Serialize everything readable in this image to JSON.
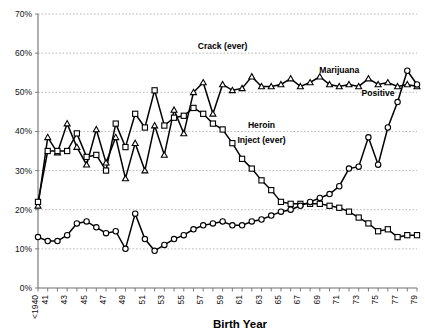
{
  "chart_data": {
    "type": "line",
    "title": "",
    "xlabel": "Birth Year",
    "ylabel": "",
    "ylim": [
      0,
      70
    ],
    "ytick_labels": [
      "0%",
      "10%",
      "20%",
      "30%",
      "40%",
      "50%",
      "60%",
      "70%"
    ],
    "ytick_values": [
      0,
      10,
      20,
      30,
      40,
      50,
      60,
      70
    ],
    "grid": true,
    "legend_position": "inline-annotations",
    "x": [
      "<1940",
      "1941",
      "1942",
      "1943",
      "1944",
      "1945",
      "1946",
      "1947",
      "1948",
      "1949",
      "1950",
      "1951",
      "1952",
      "1953",
      "1954",
      "1955",
      "1956",
      "1957",
      "1958",
      "1959",
      "1960",
      "1961",
      "1962",
      "1963",
      "1964",
      "1965",
      "1966",
      "1967",
      "1968",
      "1969",
      "1970",
      "1971",
      "1972",
      "1973",
      "1974",
      "1975",
      "1976",
      "1977",
      "1978",
      "1979"
    ],
    "xtick_labels": [
      "<1940",
      "41",
      "43",
      "45",
      "47",
      "49",
      "51",
      "53",
      "55",
      "57",
      "59",
      "61",
      "63",
      "65",
      "67",
      "69",
      "71",
      "73",
      "75",
      "77",
      "79"
    ],
    "series": [
      {
        "name": "Crack (ever)",
        "marker": "triangle",
        "label_text": "Crack (ever)",
        "values": [
          21.0,
          38.5,
          34.6,
          42.0,
          36.0,
          31.5,
          40.5,
          32.0,
          38.5,
          28.0,
          37.0,
          30.0,
          41.5,
          34.0,
          45.5,
          39.5,
          50.0,
          52.5,
          44.5,
          52.0,
          50.5,
          51.0,
          54.0,
          51.5,
          51.5,
          52.0,
          53.5,
          51.5,
          52.5,
          54.0,
          52.0,
          51.5,
          52.0,
          51.5,
          53.5,
          52.0,
          52.5,
          51.5,
          52.0,
          51.5
        ]
      },
      {
        "name": "Heroin Inject (ever)",
        "marker": "square",
        "label_text": "Heroin Inject (ever)",
        "values": [
          22.0,
          35.0,
          35.0,
          35.0,
          39.5,
          33.5,
          34.0,
          30.0,
          42.0,
          36.0,
          44.5,
          41.0,
          50.5,
          41.5,
          43.5,
          44.0,
          46.0,
          44.5,
          42.0,
          40.5,
          37.0,
          33.0,
          30.5,
          27.5,
          25.0,
          22.0,
          21.5,
          21.5,
          21.5,
          21.5,
          21.0,
          20.5,
          19.5,
          18.0,
          16.5,
          14.5,
          15.0,
          13.0,
          13.5,
          13.5
        ]
      },
      {
        "name": "Marijuana Positive",
        "marker": "circle",
        "label_text": "Marijuana",
        "label_text2": "Positive",
        "values": [
          13.0,
          12.0,
          12.0,
          13.5,
          16.5,
          17.0,
          15.5,
          14.0,
          14.5,
          10.0,
          19.0,
          12.5,
          9.5,
          11.0,
          12.5,
          13.5,
          15.0,
          16.0,
          16.5,
          17.0,
          16.0,
          16.0,
          17.0,
          17.5,
          18.5,
          19.5,
          20.0,
          21.0,
          22.0,
          23.0,
          24.0,
          26.0,
          30.5,
          31.0,
          38.5,
          31.5,
          41.0,
          47.5,
          55.5,
          52.0
        ]
      }
    ],
    "annotations": [
      {
        "text": "Crack (ever)",
        "x": 1959,
        "y": 61
      },
      {
        "text": "Heroin",
        "x": 1963,
        "y": 41
      },
      {
        "text": "Inject (ever)",
        "x": 1963,
        "y": 37
      },
      {
        "text": "Marijuana",
        "x": 1971,
        "y": 55
      },
      {
        "text": "Positive",
        "x": 1975,
        "y": 49
      }
    ]
  },
  "axis": {
    "x_title": "Birth Year"
  }
}
